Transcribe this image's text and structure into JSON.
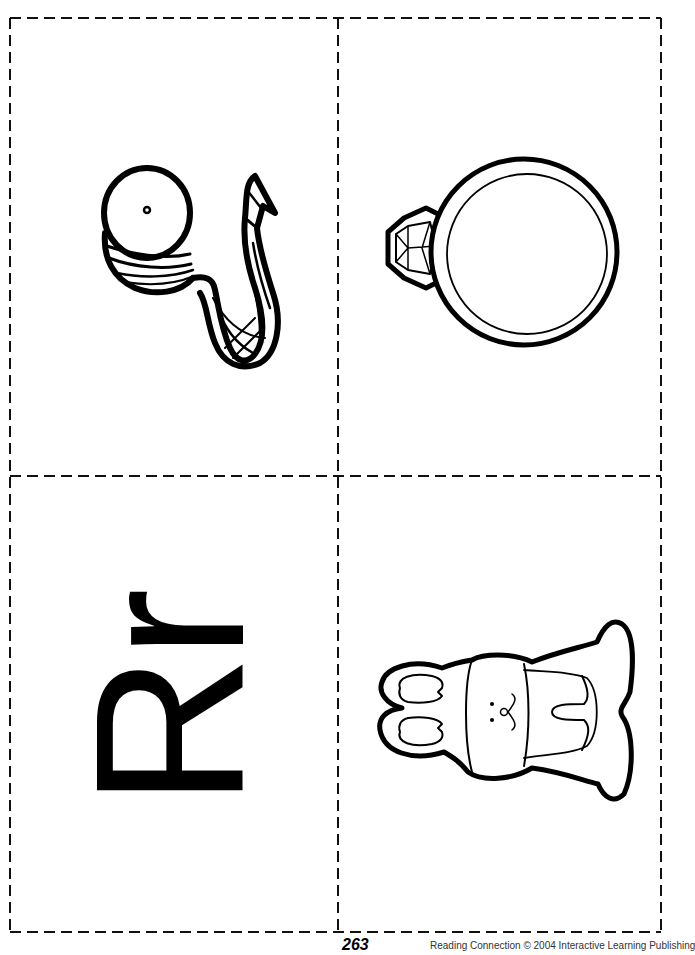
{
  "page": {
    "type": "printable letter picture cards",
    "background_color": "#ffffff",
    "line_color": "#000000",
    "layout": "2x2 grid of cut-out cards separated by dashed cut lines"
  },
  "cards": [
    {
      "position": "top-left",
      "content_type": "picture",
      "picture": "ribbon-spool",
      "rotation_degrees": -90
    },
    {
      "position": "top-right",
      "content_type": "picture",
      "picture": "ring",
      "rotation_degrees": -90
    },
    {
      "position": "bottom-left",
      "content_type": "letter",
      "letter_text": "Rr",
      "rotation_degrees": -90
    },
    {
      "position": "bottom-right",
      "content_type": "picture",
      "picture": "rabbit",
      "rotation_degrees": -90
    }
  ],
  "footer": {
    "page_number": "263",
    "copyright_text": "Reading  Connection  © 2004  Interactive Learning Publishing"
  }
}
